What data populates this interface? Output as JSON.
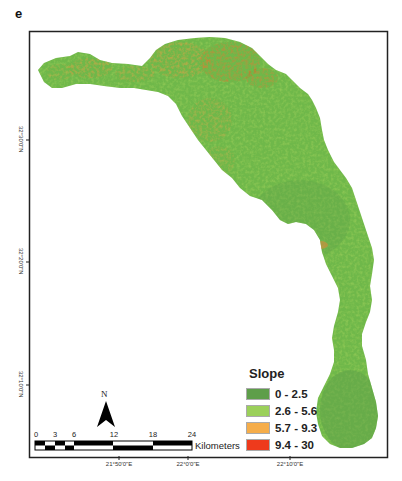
{
  "panel_label": "e",
  "legend": {
    "title": "Slope",
    "classes": [
      {
        "label": "0 - 2.5",
        "color": "#5e9e4a"
      },
      {
        "label": "2.6 - 5.6",
        "color": "#9bd05a"
      },
      {
        "label": "5.7 - 9.3",
        "color": "#f5ad4a"
      },
      {
        "label": "9.4 - 30",
        "color": "#ee3a1c"
      }
    ]
  },
  "graticule": {
    "latitudes": [
      "32°30'0\"N",
      "32°20'0\"N",
      "32°10'0\"N"
    ],
    "longitudes": [
      "21°50'0\"E",
      "22°0'0\"E",
      "22°10'0\"E"
    ]
  },
  "north_arrow": {
    "label": "N"
  },
  "scale_bar": {
    "ticks": [
      "0",
      "3",
      "6",
      "12",
      "18",
      "24"
    ],
    "unit": "Kilometers"
  },
  "colors": {
    "base_green": "#6fb84a",
    "light_green": "#9bd05a",
    "orange": "#e8873a",
    "red": "#e0501e"
  }
}
